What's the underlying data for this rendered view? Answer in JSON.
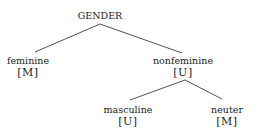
{
  "diagram": {
    "type": "feature-tree",
    "root": {
      "label": "GENDER"
    },
    "nodes": [
      {
        "id": "feminine",
        "label": "feminine",
        "feature": "[M]"
      },
      {
        "id": "nonfeminine",
        "label": "nonfeminine",
        "feature": "[U]"
      },
      {
        "id": "masculine",
        "label": "masculine",
        "feature": "[U]"
      },
      {
        "id": "neuter",
        "label": "neuter",
        "feature": "[M]"
      }
    ],
    "edges": [
      {
        "from": "GENDER",
        "to": "feminine"
      },
      {
        "from": "GENDER",
        "to": "nonfeminine"
      },
      {
        "from": "nonfeminine",
        "to": "masculine"
      },
      {
        "from": "nonfeminine",
        "to": "neuter"
      }
    ],
    "line_color": "#555555",
    "text_color": "#222222"
  }
}
